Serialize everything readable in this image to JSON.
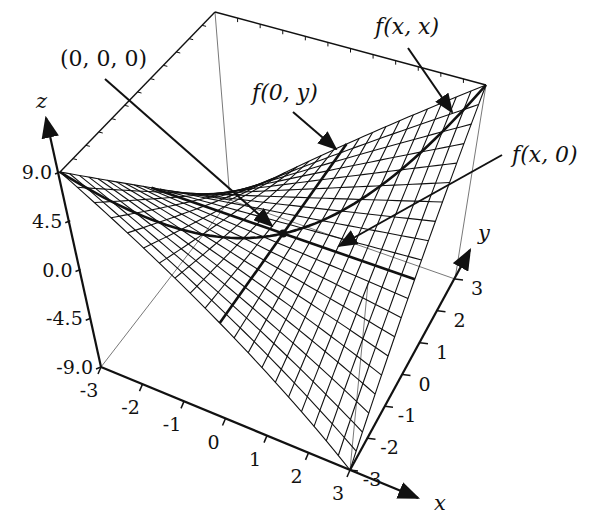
{
  "chart_data": {
    "type": "surface3d",
    "title": "",
    "function": "f(x,y) = x*y",
    "xlabel": "x",
    "ylabel": "y",
    "zlabel": "z",
    "xlim": [
      -3,
      3
    ],
    "ylim": [
      -3,
      3
    ],
    "zlim": [
      -9,
      9
    ],
    "x_ticks": [
      "-3",
      "-2",
      "-1",
      "0",
      "1",
      "2",
      "3"
    ],
    "y_ticks": [
      "-3",
      "-2",
      "-1",
      "0",
      "1",
      "2",
      "3"
    ],
    "z_ticks": [
      "-9.0",
      "-4.5",
      "0.0",
      "4.5",
      "9.0"
    ],
    "mesh_resolution": 20,
    "highlighted_curves": [
      {
        "name": "f(x,x)",
        "description": "x^2 along diagonal y=x"
      },
      {
        "name": "f(0,y)",
        "description": "zero line along x=0"
      },
      {
        "name": "f(x,0)",
        "description": "zero line along y=0"
      }
    ],
    "highlighted_points": [
      {
        "name": "(0,0,0)",
        "x": 0,
        "y": 0,
        "z": 0
      }
    ],
    "annotations": [
      {
        "text": "(0, 0, 0)",
        "target": "origin saddle point"
      },
      {
        "text": "f(0, y)",
        "target": "line x=0"
      },
      {
        "text": "f(x, x)",
        "target": "diagonal curve"
      },
      {
        "text": "f(x, 0)",
        "target": "line y=0"
      }
    ],
    "grid": false,
    "legend": "none"
  },
  "labels": {
    "origin": "(0, 0, 0)",
    "f0y": "f(0, y)",
    "fxx": "f(x, x)",
    "fx0": "f(x, 0)",
    "x_axis": "x",
    "y_axis": "y",
    "z_axis": "z"
  }
}
